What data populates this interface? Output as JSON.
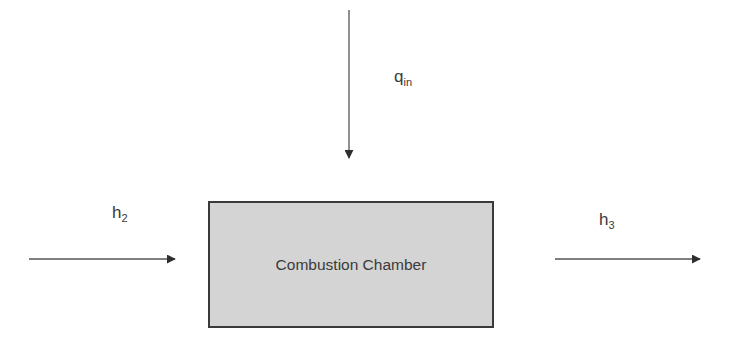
{
  "diagram": {
    "component": {
      "label": "Combustion Chamber",
      "fill_color": "#d4d4d4",
      "border_color": "#3a3a3a"
    },
    "arrows": [
      {
        "id": "heat-in",
        "direction": "down",
        "label_main": "q",
        "label_sub": "in"
      },
      {
        "id": "inlet",
        "direction": "right",
        "label_main": "h",
        "label_sub": "2"
      },
      {
        "id": "outlet",
        "direction": "right",
        "label_main": "h",
        "label_sub": "3"
      }
    ],
    "line_color": "#3a3a3a"
  }
}
